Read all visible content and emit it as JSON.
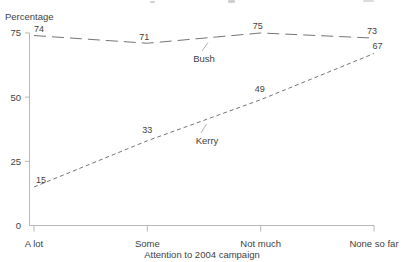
{
  "chart_data": {
    "type": "line",
    "title": "",
    "categories": [
      "A lot",
      "Some",
      "Not much",
      "None so far"
    ],
    "series": [
      {
        "name": "Bush",
        "values": [
          74,
          71,
          75,
          73
        ],
        "dash": "long"
      },
      {
        "name": "Kerry",
        "values": [
          15,
          33,
          49,
          67
        ],
        "dash": "short"
      }
    ],
    "ylabel": "Percentage",
    "xlabel": "Attention to 2004 campaign",
    "yticks": [
      0,
      25,
      50,
      75
    ],
    "ylim": [
      0,
      80
    ],
    "grid": false,
    "legend": "inline series labels with leader lines",
    "data_labels": true
  },
  "colors": {
    "background": "#ffffff",
    "text": "#3f3f3f",
    "axis": "#b8b8b8",
    "series_line": "#757575",
    "leader": "#a0a0a0"
  }
}
